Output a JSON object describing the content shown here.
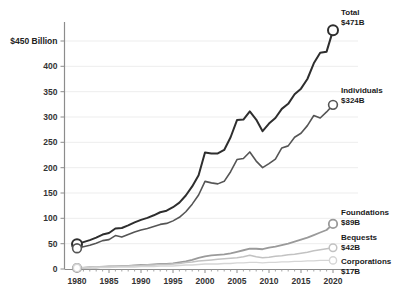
{
  "chart_data": {
    "type": "line",
    "title": "",
    "subtitle": "",
    "xlabel": "",
    "ylabel": "",
    "y_axis_top_label": "$450 Billion",
    "ylim": [
      0,
      480
    ],
    "xlim": [
      1978,
      2022
    ],
    "grid": true,
    "legend_position": "right-inline-labels",
    "ytick_labels": [
      "$450 Billion",
      "400",
      "350",
      "300",
      "250",
      "200",
      "150",
      "100",
      "50",
      "0"
    ],
    "ytick_values": [
      450,
      400,
      350,
      300,
      250,
      200,
      150,
      100,
      50,
      0
    ],
    "xtick_labels": [
      "1980",
      "1985",
      "1990",
      "1995",
      "2000",
      "2005",
      "2010",
      "2015",
      "2020"
    ],
    "xtick_values": [
      1980,
      1985,
      1990,
      1995,
      2000,
      2005,
      2010,
      2015,
      2020
    ],
    "x": [
      1980,
      1981,
      1982,
      1983,
      1984,
      1985,
      1986,
      1987,
      1988,
      1989,
      1990,
      1991,
      1992,
      1993,
      1994,
      1995,
      1996,
      1997,
      1998,
      1999,
      2000,
      2001,
      2002,
      2003,
      2004,
      2005,
      2006,
      2007,
      2008,
      2009,
      2010,
      2011,
      2012,
      2013,
      2014,
      2015,
      2016,
      2017,
      2018,
      2019,
      2020
    ],
    "series": [
      {
        "name": "Total",
        "end_label": "Total",
        "end_value_label": "$471B",
        "end_value": 471,
        "color": "#2e2e2e",
        "stroke_width": 2.0,
        "values": [
          49,
          53,
          57,
          62,
          68,
          71,
          80,
          81,
          86,
          92,
          97,
          101,
          106,
          112,
          115,
          122,
          131,
          145,
          163,
          185,
          230,
          228,
          228,
          235,
          260,
          294,
          295,
          311,
          295,
          272,
          287,
          298,
          316,
          326,
          345,
          356,
          375,
          406,
          427,
          429,
          471
        ]
      },
      {
        "name": "Individuals",
        "end_label": "Individuals",
        "end_value_label": "$324B",
        "end_value": 324,
        "color": "#555555",
        "stroke_width": 1.6,
        "values": [
          41,
          44,
          47,
          51,
          56,
          58,
          66,
          63,
          68,
          73,
          77,
          80,
          84,
          88,
          90,
          95,
          102,
          113,
          128,
          146,
          173,
          170,
          168,
          173,
          192,
          216,
          218,
          231,
          213,
          200,
          208,
          217,
          239,
          243,
          260,
          268,
          283,
          303,
          298,
          310,
          324
        ]
      },
      {
        "name": "Foundations",
        "end_label": "Foundations",
        "end_value_label": "$89B",
        "end_value": 89,
        "color": "#9a9a9a",
        "stroke_width": 1.8,
        "values": [
          2,
          2,
          3,
          3,
          4,
          5,
          5,
          6,
          6,
          7,
          8,
          8,
          9,
          10,
          10,
          11,
          13,
          15,
          18,
          22,
          25,
          27,
          28,
          29,
          31,
          34,
          37,
          40,
          40,
          39,
          42,
          44,
          47,
          50,
          54,
          58,
          62,
          67,
          72,
          77,
          89
        ]
      },
      {
        "name": "Bequests",
        "end_label": "Bequests",
        "end_value_label": "$42B",
        "end_value": 42,
        "color": "#c2c2c2",
        "stroke_width": 1.5,
        "values": [
          3,
          3,
          4,
          4,
          5,
          5,
          6,
          6,
          6,
          7,
          7,
          8,
          8,
          9,
          9,
          10,
          11,
          13,
          14,
          16,
          17,
          18,
          19,
          20,
          21,
          22,
          24,
          27,
          24,
          22,
          23,
          25,
          26,
          28,
          29,
          31,
          33,
          36,
          38,
          40,
          42
        ]
      },
      {
        "name": "Corporations",
        "end_label": "Corporations",
        "end_value_label": "$17B",
        "end_value": 17,
        "color": "#d5d5d5",
        "stroke_width": 1.4,
        "values": [
          2,
          2,
          2,
          3,
          3,
          3,
          4,
          4,
          4,
          4,
          5,
          5,
          5,
          6,
          6,
          6,
          7,
          8,
          8,
          9,
          10,
          10,
          10,
          11,
          11,
          12,
          12,
          13,
          13,
          12,
          13,
          13,
          14,
          14,
          15,
          15,
          16,
          16,
          17,
          17,
          17
        ]
      }
    ]
  }
}
